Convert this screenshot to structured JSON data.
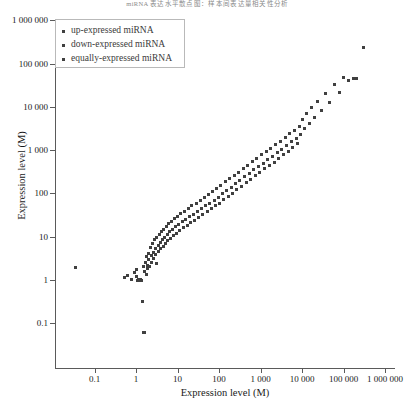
{
  "supertitle": "miRNA 表达水平散点图：样本间表达量相关性分析",
  "chart_data": {
    "type": "scatter",
    "title": "",
    "xlabel": "Expression level (M)",
    "ylabel": "Expression level (M)",
    "xscale": "log",
    "yscale": "log",
    "grid": false,
    "xlim": [
      0.03,
      1000000
    ],
    "ylim": [
      0.05,
      1000000
    ],
    "xticks": [
      0.1,
      1,
      10,
      100,
      1000,
      10000,
      100000,
      1000000
    ],
    "xticklabels": [
      "0.1",
      "1",
      "10",
      "100",
      "1 000",
      "10 000",
      "100 000",
      "1 000 000"
    ],
    "yticks": [
      0.1,
      1,
      10,
      100,
      1000,
      10000,
      100000,
      1000000
    ],
    "yticklabels": [
      "0.1",
      "1",
      "10",
      "100",
      "1 000",
      "10 000",
      "100 000",
      "1 000 000"
    ],
    "legend_position": "upper-left",
    "marker_color": "#404040",
    "series": [
      {
        "name": "up-expressed miRNA",
        "color": "#404040",
        "points": []
      },
      {
        "name": "down-expressed miRNA",
        "color": "#404040",
        "points": []
      },
      {
        "name": "equally-expressed miRNA",
        "color": "#404040",
        "points": [
          [
            0.035,
            1.9
          ],
          [
            0.52,
            1.15
          ],
          [
            0.62,
            1.25
          ],
          [
            0.78,
            1.05
          ],
          [
            0.9,
            1.5
          ],
          [
            1.0,
            1.75
          ],
          [
            1.05,
            1.2
          ],
          [
            1.1,
            1.0
          ],
          [
            1.15,
            1.05
          ],
          [
            1.2,
            1.0
          ],
          [
            1.25,
            1.02
          ],
          [
            1.3,
            1.0
          ],
          [
            1.35,
            1.0
          ],
          [
            1.45,
            0.32
          ],
          [
            1.5,
            0.06
          ],
          [
            1.62,
            0.06
          ],
          [
            1.55,
            2.1
          ],
          [
            1.6,
            1.6
          ],
          [
            1.7,
            2.6
          ],
          [
            1.75,
            1.35
          ],
          [
            1.8,
            3.4
          ],
          [
            1.85,
            2.2
          ],
          [
            1.9,
            1.8
          ],
          [
            2.0,
            4.2
          ],
          [
            2.05,
            2.9
          ],
          [
            2.1,
            2.0
          ],
          [
            2.2,
            5.5
          ],
          [
            2.3,
            3.6
          ],
          [
            2.4,
            2.5
          ],
          [
            2.5,
            6.8
          ],
          [
            2.6,
            4.4
          ],
          [
            2.7,
            3.1
          ],
          [
            2.8,
            8.5
          ],
          [
            2.9,
            5.2
          ],
          [
            3.0,
            3.8
          ],
          [
            3.1,
            2.4
          ],
          [
            3.2,
            9.5
          ],
          [
            3.4,
            6.2
          ],
          [
            3.5,
            4.6
          ],
          [
            3.6,
            11.0
          ],
          [
            3.8,
            7.2
          ],
          [
            4.0,
            5.4
          ],
          [
            4.1,
            13.0
          ],
          [
            4.3,
            8.4
          ],
          [
            4.5,
            6.0
          ],
          [
            4.7,
            15.0
          ],
          [
            4.9,
            9.6
          ],
          [
            5.1,
            7.0
          ],
          [
            5.3,
            17.5
          ],
          [
            5.6,
            11.0
          ],
          [
            5.9,
            8.0
          ],
          [
            6.2,
            20.0
          ],
          [
            6.5,
            13.0
          ],
          [
            6.8,
            9.2
          ],
          [
            7.2,
            23.0
          ],
          [
            7.6,
            15.0
          ],
          [
            8.0,
            10.5
          ],
          [
            8.5,
            26.0
          ],
          [
            9.0,
            17.0
          ],
          [
            9.5,
            12.0
          ],
          [
            10.0,
            30.0
          ],
          [
            10.5,
            19.0
          ],
          [
            11.0,
            14.0
          ],
          [
            12.0,
            34.0
          ],
          [
            13.0,
            22.0
          ],
          [
            14.0,
            16.0
          ],
          [
            15.0,
            39.0
          ],
          [
            16.0,
            25.0
          ],
          [
            17.0,
            18.0
          ],
          [
            18.0,
            45.0
          ],
          [
            19.0,
            29.0
          ],
          [
            21.0,
            21.0
          ],
          [
            22.0,
            52.0
          ],
          [
            24.0,
            33.0
          ],
          [
            26.0,
            24.0
          ],
          [
            28.0,
            60.0
          ],
          [
            30.0,
            38.0
          ],
          [
            32.0,
            28.0
          ],
          [
            35.0,
            70.0
          ],
          [
            38.0,
            44.0
          ],
          [
            41.0,
            32.0
          ],
          [
            44.0,
            82.0
          ],
          [
            48.0,
            52.0
          ],
          [
            52.0,
            38.0
          ],
          [
            56.0,
            95.0
          ],
          [
            60.0,
            60.0
          ],
          [
            65.0,
            44.0
          ],
          [
            70.0,
            110.0
          ],
          [
            76.0,
            70.0
          ],
          [
            82.0,
            52.0
          ],
          [
            88.0,
            130.0
          ],
          [
            95.0,
            82.0
          ],
          [
            102.0,
            60.0
          ],
          [
            110.0,
            155.0
          ],
          [
            120.0,
            98.0
          ],
          [
            130.0,
            72.0
          ],
          [
            140.0,
            185.0
          ],
          [
            150.0,
            115.0
          ],
          [
            165.0,
            86.0
          ],
          [
            180.0,
            220.0
          ],
          [
            195.0,
            140.0
          ],
          [
            210.0,
            100.0
          ],
          [
            230.0,
            260.0
          ],
          [
            250.0,
            165.0
          ],
          [
            270.0,
            120.0
          ],
          [
            295.0,
            310.0
          ],
          [
            320.0,
            200.0
          ],
          [
            350.0,
            145.0
          ],
          [
            380.0,
            380.0
          ],
          [
            410.0,
            240.0
          ],
          [
            450.0,
            175.0
          ],
          [
            490.0,
            450.0
          ],
          [
            530.0,
            290.0
          ],
          [
            580.0,
            210.0
          ],
          [
            630.0,
            540.0
          ],
          [
            690.0,
            350.0
          ],
          [
            750.0,
            255.0
          ],
          [
            820.0,
            650.0
          ],
          [
            890.0,
            420.0
          ],
          [
            970.0,
            310.0
          ],
          [
            1060.0,
            780.0
          ],
          [
            1150.0,
            500.0
          ],
          [
            1260.0,
            370.0
          ],
          [
            1370.0,
            930.0
          ],
          [
            1500.0,
            600.0
          ],
          [
            1630.0,
            440.0
          ],
          [
            1780.0,
            1100.0
          ],
          [
            1940.0,
            720.0
          ],
          [
            2120.0,
            530.0
          ],
          [
            2300.0,
            1350.0
          ],
          [
            2500.0,
            870.0
          ],
          [
            2750.0,
            640.0
          ],
          [
            3000.0,
            1600.0
          ],
          [
            3250.0,
            1050.0
          ],
          [
            3550.0,
            780.0
          ],
          [
            3900.0,
            1950.0
          ],
          [
            4250.0,
            1280.0
          ],
          [
            4600.0,
            940.0
          ],
          [
            5000.0,
            2400.0
          ],
          [
            5500.0,
            1550.0
          ],
          [
            6000.0,
            1150.0
          ],
          [
            6600.0,
            2900.0
          ],
          [
            7200.0,
            1900.0
          ],
          [
            7900.0,
            1400.0
          ],
          [
            8600.0,
            3600.0
          ],
          [
            9400.0,
            2300.0
          ],
          [
            10500.0,
            5200.0
          ],
          [
            11500.0,
            3100.0
          ],
          [
            13000.0,
            7000.0
          ],
          [
            15000.0,
            4200.0
          ],
          [
            17000.0,
            9500.0
          ],
          [
            20000.0,
            5800.0
          ],
          [
            24000.0,
            13000.0
          ],
          [
            29000.0,
            8200.0
          ],
          [
            36000.0,
            20000.0
          ],
          [
            45000.0,
            12500.0
          ],
          [
            60000.0,
            32000.0
          ],
          [
            78000.0,
            21000.0
          ],
          [
            100000.0,
            48000.0
          ],
          [
            130000.0,
            40000.0
          ],
          [
            175000.0,
            44000.0
          ],
          [
            210000.0,
            46000.0
          ],
          [
            300000.0,
            230000.0
          ]
        ]
      }
    ],
    "legend": [
      "up-expressed miRNA",
      "down-expressed miRNA",
      "equally-expressed miRNA"
    ]
  }
}
